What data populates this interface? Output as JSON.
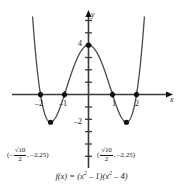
{
  "figure": {
    "kind": "cartesian-graph",
    "background_color": "#ffffff",
    "curve_color": "#4a4a4a",
    "axis_color": "#3a3a3a",
    "point_color": "#111111"
  },
  "axes": {
    "x_axis_label": "x",
    "y_axis_label": "y",
    "x_ticks": [
      {
        "value": -2,
        "label": "–2"
      },
      {
        "value": -1,
        "label": "–1"
      },
      {
        "value": 1,
        "label": "1"
      },
      {
        "value": 2,
        "label": "2"
      }
    ],
    "y_ticks": [
      {
        "value": 4,
        "label": "4"
      },
      {
        "value": -2,
        "label": "–2"
      }
    ]
  },
  "annotations": {
    "left_min": {
      "open_paren": "(–",
      "numerator": "√10",
      "denominator": "2",
      "comma_value": ", –2.25)"
    },
    "right_min": {
      "open_paren": "(",
      "numerator": "√10",
      "denominator": "2",
      "comma_value": ", –2.25)"
    }
  },
  "formula": {
    "fx": "f(x)",
    "equals": "=",
    "expression_a_base": "(x",
    "expression_a_exp": "2",
    "expression_a_tail": " – 1)",
    "expression_b_base": "(x",
    "expression_b_exp": "2",
    "expression_b_tail": " – 4)",
    "full_text": "f(x) = (x² – 1)(x² – 4)"
  },
  "chart_data": {
    "type": "line",
    "title": "",
    "subtitle": "",
    "xlabel": "x",
    "ylabel": "y",
    "xlim": [
      -2.85,
      2.85
    ],
    "ylim": [
      -3.6,
      6.1
    ],
    "grid": false,
    "legend": null,
    "function_expression": "f(x) = (x^2 - 1)(x^2 - 4)",
    "series": [
      {
        "name": "f(x) = (x^2 - 1)(x^2 - 4)",
        "color": "#4a4a4a",
        "x": [
          -2.6,
          -2.5,
          -2.4,
          -2.3,
          -2.2,
          -2.1,
          -2.0,
          -1.9,
          -1.8,
          -1.7,
          -1.6,
          -1.5,
          -1.4,
          -1.3,
          -1.2,
          -1.1,
          -1.0,
          -0.9,
          -0.8,
          -0.7,
          -0.6,
          -0.5,
          -0.4,
          -0.3,
          -0.2,
          -0.1,
          0.0,
          0.1,
          0.2,
          0.3,
          0.4,
          0.5,
          0.6,
          0.7,
          0.8,
          0.9,
          1.0,
          1.1,
          1.2,
          1.3,
          1.4,
          1.5,
          1.6,
          1.7,
          1.8,
          1.9,
          2.0,
          2.1,
          2.2,
          2.3,
          2.4,
          2.5,
          2.6
        ],
        "y": [
          16.06,
          12.94,
          10.19,
          7.79,
          5.71,
          3.94,
          0.0,
          -1.23,
          -2.02,
          -2.44,
          -2.58,
          -2.44,
          -2.11,
          -1.67,
          -1.19,
          -0.73,
          0.0,
          0.36,
          0.66,
          0.9,
          1.08,
          1.22,
          1.32,
          1.4,
          1.45,
          1.48,
          4.0,
          1.48,
          1.45,
          1.4,
          1.32,
          1.22,
          1.08,
          0.9,
          0.66,
          0.36,
          0.0,
          -0.73,
          -1.19,
          -1.67,
          -2.11,
          -2.44,
          -2.58,
          -2.44,
          -2.02,
          -1.23,
          0.0,
          3.94,
          5.71,
          7.79,
          10.19,
          12.94,
          16.06
        ]
      }
    ],
    "marked_points": [
      {
        "x": -2.0,
        "y": 0.0,
        "label": "–2"
      },
      {
        "x": -1.0,
        "y": 0.0,
        "label": "–1"
      },
      {
        "x": 1.0,
        "y": 0.0,
        "label": "1"
      },
      {
        "x": 2.0,
        "y": 0.0,
        "label": "2"
      },
      {
        "x": 0.0,
        "y": 4.0,
        "label": "4"
      },
      {
        "x": -1.5811,
        "y": -2.25,
        "label": "(-√10/2, -2.25)"
      },
      {
        "x": 1.5811,
        "y": -2.25,
        "label": "(√10/2, -2.25)"
      }
    ]
  }
}
